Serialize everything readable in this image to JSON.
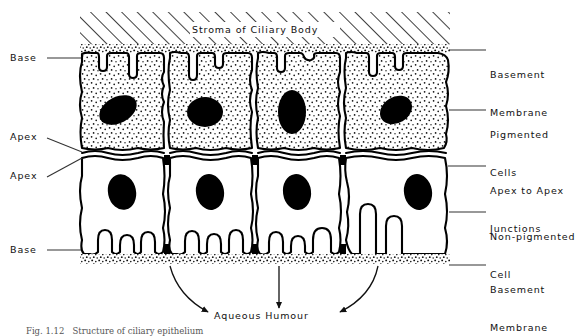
{
  "figure": {
    "title": "Stroma of Ciliary Body",
    "caption": "Fig. 1.12   Structure of ciliary epithelium",
    "bottom_label": "Aqueous Humour"
  },
  "labels_left": [
    {
      "text": "Base",
      "name": "label-base-top"
    },
    {
      "text": "Apex",
      "name": "label-apex-upper"
    },
    {
      "text": "Apex",
      "name": "label-apex-lower"
    },
    {
      "text": "Base",
      "name": "label-base-bottom"
    }
  ],
  "labels_right": [
    {
      "line1": "Basement",
      "line2": "Membrane",
      "name": "label-basement-membrane-top"
    },
    {
      "line1": "Pigmented",
      "line2": "Cells",
      "name": "label-pigmented-cells"
    },
    {
      "line1": "Apex to Apex",
      "line2": "Junctions",
      "name": "label-apex-to-apex-junctions"
    },
    {
      "line1": "Non-pigmented",
      "line2": "Cell",
      "name": "label-non-pigmented-cell"
    },
    {
      "line1": "Basement",
      "line2": "Membrane",
      "name": "label-basement-membrane-bottom"
    }
  ],
  "colors": {
    "ink": "#111111",
    "stroke": "#000000",
    "nucleus": "#000000",
    "background": "#ffffff",
    "leader": "#333333"
  },
  "structures": {
    "stroma_hatching": "diagonal-hatch",
    "pigmented_cell_count": 4,
    "non_pigmented_cell_count": 4,
    "cytoplasm_pigmented": "stippled",
    "cytoplasm_non_pigmented": "clear",
    "arrow_count": 3
  }
}
